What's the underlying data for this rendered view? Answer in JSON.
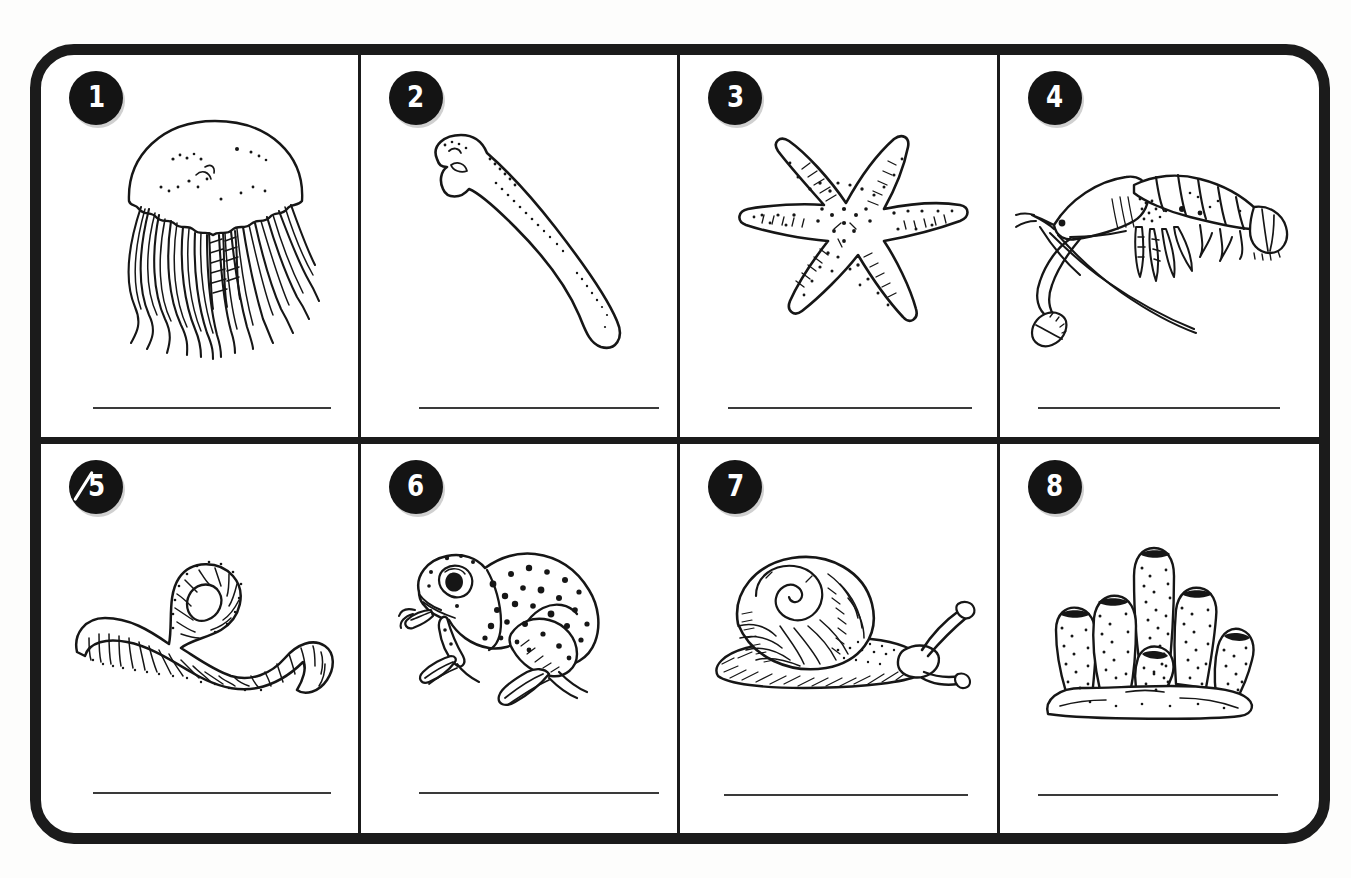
{
  "document": {
    "kind": "worksheet",
    "layout": {
      "columns": 4,
      "rows": 2,
      "cell_count": 8
    },
    "frame": {
      "style": "thick-rounded-rectangle",
      "color": "#1b1b1b"
    },
    "colors": {
      "ink": "#161616",
      "frame": "#1b1b1b",
      "badge_bg": "#141414",
      "badge_text": "#ffffff",
      "answer_line": "#3a3a3a",
      "paper": "#fdfdfc"
    },
    "answer_line": {
      "present_in_every_cell": true,
      "value": "",
      "placeholder": ""
    }
  },
  "cells": [
    {
      "number": "1",
      "subject": "jellyfish",
      "icon": "jellyfish-icon",
      "answer": "",
      "badge_marked": false
    },
    {
      "number": "2",
      "subject": "tadpole",
      "icon": "tadpole-icon",
      "answer": "",
      "badge_marked": false
    },
    {
      "number": "3",
      "subject": "starfish",
      "icon": "starfish-icon",
      "answer": "",
      "badge_marked": false
    },
    {
      "number": "4",
      "subject": "shrimp",
      "icon": "shrimp-icon",
      "answer": "",
      "badge_marked": false
    },
    {
      "number": "5",
      "subject": "earthworm",
      "icon": "earthworm-icon",
      "answer": "",
      "badge_marked": true
    },
    {
      "number": "6",
      "subject": "frog",
      "icon": "frog-icon",
      "answer": "",
      "badge_marked": false
    },
    {
      "number": "7",
      "subject": "snail",
      "icon": "snail-icon",
      "answer": "",
      "badge_marked": false
    },
    {
      "number": "8",
      "subject": "tube-sponge",
      "icon": "tube-sponge-icon",
      "answer": "",
      "badge_marked": false
    }
  ]
}
